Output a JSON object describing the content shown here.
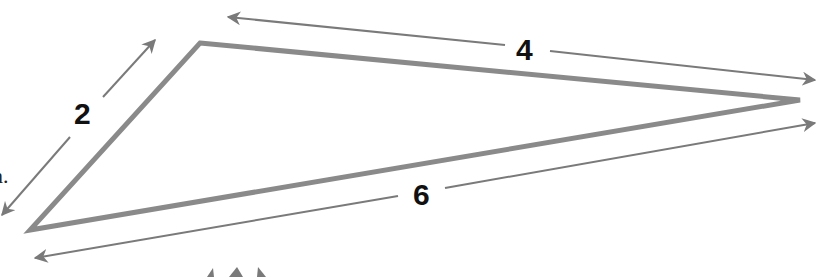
{
  "diagram": {
    "type": "triangle-with-dimension-arrows",
    "colors": {
      "stroke": "#8a8a8a",
      "arrow": "#7a7a7a",
      "label": "#111111",
      "background": "#ffffff"
    },
    "triangle": {
      "vertices": [
        [
          200,
          43
        ],
        [
          800,
          100
        ],
        [
          30,
          230
        ]
      ]
    },
    "sides": [
      {
        "label": "2",
        "between": "left-vertex and top-vertex"
      },
      {
        "label": "4",
        "between": "top-vertex and right-vertex"
      },
      {
        "label": "6",
        "between": "left-vertex and right-vertex"
      }
    ],
    "cut_text": "n."
  }
}
